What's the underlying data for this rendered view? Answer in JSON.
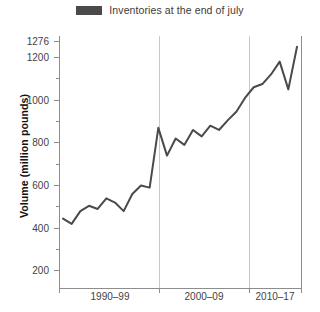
{
  "legend": {
    "swatch_color": "#4a4a4a",
    "label": "Inventories at the end of july"
  },
  "axis": {
    "ylabel": "Volume (million pounds)",
    "xlabel": ""
  },
  "chart_data": {
    "type": "line",
    "title": "",
    "subtitle": "",
    "xlabel": "",
    "ylabel": "Volume (million pounds)",
    "ylim": [
      120,
      1300
    ],
    "yticks": [
      200,
      400,
      600,
      800,
      1000,
      1200,
      1276
    ],
    "ytick_labels": [
      "200",
      "400",
      "600",
      "800",
      "1000",
      "1200",
      "1276"
    ],
    "grid": false,
    "legend_position": "top-center",
    "group_labels": [
      "1990–99",
      "2000–09",
      "2010–17"
    ],
    "group_separators_after_index": [
      9,
      19
    ],
    "line_color": "#4a4a4a",
    "series": [
      {
        "name": "Inventories at the end of july",
        "x": [
          1990,
          1991,
          1992,
          1993,
          1994,
          1995,
          1996,
          1997,
          1998,
          1999,
          2000,
          2001,
          2002,
          2003,
          2004,
          2005,
          2006,
          2007,
          2008,
          2009,
          2010,
          2011,
          2012,
          2013,
          2014,
          2015,
          2016,
          2017
        ],
        "values": [
          445,
          420,
          480,
          505,
          490,
          540,
          520,
          480,
          560,
          600,
          590,
          870,
          740,
          820,
          790,
          860,
          830,
          880,
          860,
          905,
          945,
          1010,
          1060,
          1075,
          1120,
          1180,
          1050,
          1250
        ]
      }
    ]
  },
  "plot_geometry": {
    "left": 59,
    "right": 301,
    "top": 36,
    "bottom": 288,
    "separator_x": [
      159,
      249
    ],
    "group_label_x": [
      110,
      204,
      275
    ],
    "group_label_y": 300
  }
}
